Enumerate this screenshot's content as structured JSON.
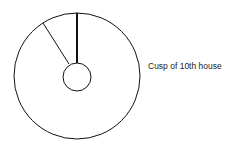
{
  "diagram": {
    "label": "Cusp of 10th house",
    "outer_circle": {
      "cx": 77,
      "cy": 76,
      "r": 63
    },
    "inner_circle": {
      "cx": 77,
      "cy": 77,
      "r": 14
    },
    "cusp_line": {
      "x1": 77,
      "y1": 13,
      "x2": 77,
      "y2": 63,
      "width": 2
    },
    "thin_line": {
      "x1": 43,
      "y1": 23,
      "x2": 69,
      "y2": 64,
      "width": 1
    },
    "stroke_color": "#111111"
  }
}
